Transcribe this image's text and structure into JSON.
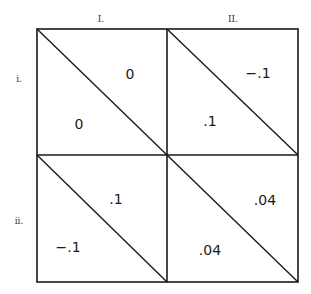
{
  "game": {
    "column_labels": [
      "I.",
      "II."
    ],
    "row_labels": [
      "i.",
      "ii."
    ],
    "cells": [
      [
        {
          "row": "i.",
          "col": "I.",
          "upper_right": "0",
          "lower_left": "0"
        },
        {
          "row": "i.",
          "col": "II.",
          "upper_right": "−.1",
          "lower_left": ".1"
        }
      ],
      [
        {
          "row": "ii.",
          "col": "I.",
          "upper_right": ".1",
          "lower_left": "−.1"
        },
        {
          "row": "ii.",
          "col": "II.",
          "upper_right": ".04",
          "lower_left": ".04"
        }
      ]
    ]
  }
}
